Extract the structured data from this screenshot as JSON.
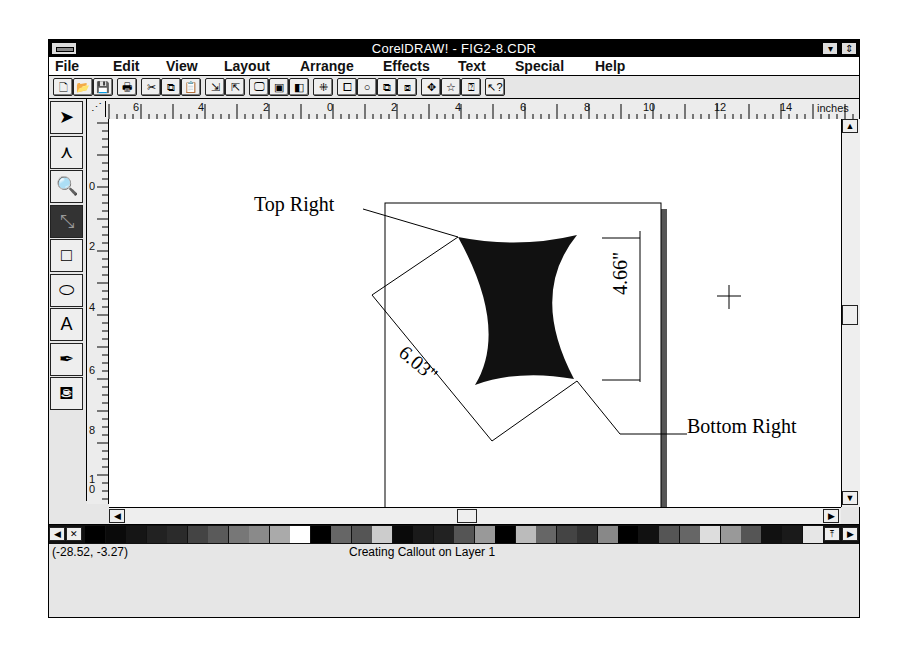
{
  "window": {
    "title": "CorelDRAW! - FIG2-8.CDR",
    "minimize_glyph": "▾",
    "restore_glyph": "⇕"
  },
  "menu": [
    {
      "label": "File",
      "x": 6
    },
    {
      "label": "Edit",
      "x": 64
    },
    {
      "label": "View",
      "x": 117
    },
    {
      "label": "Layout",
      "x": 175
    },
    {
      "label": "Arrange",
      "x": 251
    },
    {
      "label": "Effects",
      "x": 334
    },
    {
      "label": "Text",
      "x": 409
    },
    {
      "label": "Special",
      "x": 466
    },
    {
      "label": "Help",
      "x": 546
    }
  ],
  "toolbar": [
    {
      "name": "new-file",
      "glyph": "🗋",
      "x": 4
    },
    {
      "name": "open-file",
      "glyph": "📂",
      "x": 24
    },
    {
      "name": "save-file",
      "glyph": "💾",
      "x": 44
    },
    {
      "name": "print",
      "glyph": "🖶",
      "x": 68
    },
    {
      "name": "cut",
      "glyph": "✂",
      "x": 92
    },
    {
      "name": "copy",
      "glyph": "⧉",
      "x": 112
    },
    {
      "name": "paste",
      "glyph": "📋",
      "x": 132
    },
    {
      "name": "import",
      "glyph": "⇲",
      "x": 156
    },
    {
      "name": "export",
      "glyph": "⇱",
      "x": 176
    },
    {
      "name": "full-screen-preview",
      "glyph": "🖵",
      "x": 200
    },
    {
      "name": "wireframe",
      "glyph": "▣",
      "x": 220
    },
    {
      "name": "show-rulers",
      "glyph": "◧",
      "x": 240
    },
    {
      "name": "snap-to-grid",
      "glyph": "⁜",
      "x": 264
    },
    {
      "name": "group",
      "glyph": "⧠",
      "x": 288
    },
    {
      "name": "rotate",
      "glyph": "○",
      "x": 308
    },
    {
      "name": "to-front",
      "glyph": "⧉",
      "x": 328
    },
    {
      "name": "to-back",
      "glyph": "⧈",
      "x": 348
    },
    {
      "name": "move-tool",
      "glyph": "✥",
      "x": 372
    },
    {
      "name": "star-symbol",
      "glyph": "☆",
      "x": 392
    },
    {
      "name": "roll-up",
      "glyph": "⍰",
      "x": 412
    },
    {
      "name": "context-help",
      "glyph": "↖?",
      "x": 436
    }
  ],
  "tools": [
    {
      "name": "pick-tool",
      "glyph": "➤"
    },
    {
      "name": "shape-tool",
      "glyph": "⋏"
    },
    {
      "name": "zoom-tool",
      "glyph": "🔍"
    },
    {
      "name": "dimension-tool",
      "glyph": "⤡",
      "active": true
    },
    {
      "name": "rectangle-tool",
      "glyph": "□"
    },
    {
      "name": "ellipse-tool",
      "glyph": "⬭"
    },
    {
      "name": "text-tool",
      "glyph": "A"
    },
    {
      "name": "outline-pen-tool",
      "glyph": "✒"
    },
    {
      "name": "fill-tool",
      "glyph": "⛾"
    }
  ],
  "rulers": {
    "units": "inches",
    "horizontal_labels": [
      {
        "t": "6",
        "x": 46
      },
      {
        "t": "4",
        "x": 111
      },
      {
        "t": "2",
        "x": 176
      },
      {
        "t": "0",
        "x": 240
      },
      {
        "t": "2",
        "x": 304
      },
      {
        "t": "4",
        "x": 368
      },
      {
        "t": "6",
        "x": 433
      },
      {
        "t": "8",
        "x": 497
      },
      {
        "t": "10",
        "x": 556
      },
      {
        "t": "12",
        "x": 627
      },
      {
        "t": "14",
        "x": 693
      }
    ],
    "vertical_labels": [
      {
        "t": "0",
        "y": 70
      },
      {
        "t": "2",
        "y": 130
      },
      {
        "t": "4",
        "y": 191
      },
      {
        "t": "6",
        "y": 254
      },
      {
        "t": "8",
        "y": 314
      },
      {
        "t": "1\n0",
        "y": 363
      }
    ]
  },
  "drawing": {
    "callout_top": "Top Right",
    "callout_bottom": "Bottom Right",
    "dimension_height": "4.66\"",
    "dimension_diagonal": "6.03\""
  },
  "palette": [
    "#000",
    "#0a0a0a",
    "#151515",
    "#222",
    "#2b2b2b",
    "#444",
    "#5a5a5a",
    "#777",
    "#8a8a8a",
    "#aaa",
    "#fff",
    "#000",
    "#666",
    "#555",
    "#ccc",
    "#0a0a0a",
    "#1a1a1a",
    "#222",
    "#555",
    "#999",
    "#000",
    "#bbb",
    "#666",
    "#444",
    "#333",
    "#888",
    "#000",
    "#111",
    "#555",
    "#666",
    "#ddd",
    "#999",
    "#555",
    "#111",
    "#1a1a1a",
    "#e6e6e6"
  ],
  "status": {
    "coordinates": "(-28.52, -3.27)",
    "message": "Creating Callout on Layer 1"
  }
}
